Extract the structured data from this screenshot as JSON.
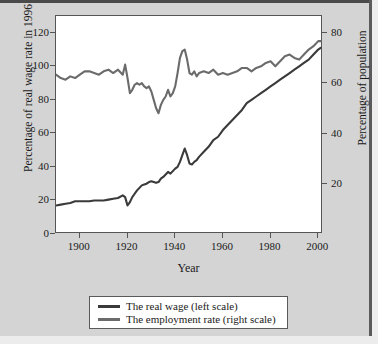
{
  "chart_data": {
    "type": "line",
    "title": "",
    "xlabel": "Year",
    "ylabel": "Percentage of real wage rate in 1996",
    "ylabel_right": "Percentage of population",
    "xlim": [
      1890,
      2002
    ],
    "ylim": [
      0,
      130
    ],
    "ylim_right": [
      0,
      86.9
    ],
    "grid": false,
    "legend_position": "below-axes",
    "xticks": [
      1900,
      1920,
      1940,
      1960,
      1980,
      2000
    ],
    "xticklabels": [
      "1900",
      "1920",
      "1940",
      "1960",
      "1980",
      "2000"
    ],
    "yticks": [
      0,
      20,
      40,
      60,
      80,
      100,
      120
    ],
    "yticklabels": [
      "0",
      "20",
      "40",
      "60",
      "80",
      "100",
      "120"
    ],
    "yticks_right": [
      20,
      40,
      60,
      80
    ],
    "yticklabels_right": [
      "20",
      "40",
      "60",
      "80"
    ],
    "series": [
      {
        "name": "The real wage (left scale)",
        "axis": "left",
        "color": "#3a3a3a",
        "linewidth": 2.1,
        "x": [
          1890,
          1892,
          1894,
          1896,
          1898,
          1900,
          1902,
          1904,
          1906,
          1908,
          1910,
          1912,
          1914,
          1916,
          1918,
          1919,
          1920,
          1921,
          1922,
          1923,
          1924,
          1925,
          1926,
          1927,
          1928,
          1929,
          1930,
          1931,
          1932,
          1933,
          1934,
          1935,
          1936,
          1937,
          1938,
          1939,
          1940,
          1941,
          1942,
          1943,
          1944,
          1945,
          1946,
          1947,
          1948,
          1949,
          1950,
          1952,
          1954,
          1956,
          1958,
          1960,
          1962,
          1964,
          1966,
          1968,
          1970,
          1972,
          1974,
          1976,
          1978,
          1980,
          1982,
          1984,
          1986,
          1988,
          1990,
          1992,
          1994,
          1996,
          1998,
          2000,
          2001
        ],
        "y": [
          17,
          17.5,
          18,
          18.5,
          19.5,
          19.5,
          19.5,
          19.5,
          20,
          20,
          20,
          20.5,
          21,
          21.5,
          23,
          22,
          17,
          19,
          22,
          24,
          26,
          27.5,
          29,
          29.5,
          30,
          31,
          31.5,
          31,
          30.5,
          31,
          33,
          34,
          35.5,
          37,
          36,
          37.5,
          39,
          40,
          43,
          47,
          51,
          47,
          42,
          41.5,
          43,
          44,
          46,
          49,
          52,
          56,
          58,
          62,
          65,
          68,
          71,
          74,
          78,
          80,
          82,
          84,
          86,
          88,
          90,
          92,
          94,
          96,
          98,
          100,
          102,
          104,
          107,
          110,
          111
        ]
      },
      {
        "name": "The employment rate (right scale)",
        "axis": "right",
        "color": "#6b6b6b",
        "linewidth": 2.1,
        "x": [
          1890,
          1892,
          1894,
          1896,
          1898,
          1900,
          1902,
          1904,
          1906,
          1908,
          1910,
          1912,
          1914,
          1916,
          1918,
          1919,
          1920,
          1921,
          1922,
          1923,
          1924,
          1925,
          1926,
          1927,
          1928,
          1929,
          1930,
          1931,
          1932,
          1933,
          1934,
          1935,
          1936,
          1937,
          1938,
          1939,
          1940,
          1941,
          1942,
          1943,
          1944,
          1945,
          1946,
          1947,
          1948,
          1949,
          1950,
          1952,
          1954,
          1956,
          1958,
          1960,
          1962,
          1964,
          1966,
          1968,
          1970,
          1972,
          1974,
          1976,
          1978,
          1980,
          1982,
          1984,
          1986,
          1988,
          1990,
          1992,
          1994,
          1996,
          1998,
          2000,
          2001
        ],
        "y_left_scale": [
          95,
          93,
          92,
          94,
          93,
          95,
          97,
          97,
          96,
          95,
          97,
          98,
          96,
          98,
          95,
          101,
          93,
          84,
          86,
          89,
          90,
          89,
          90,
          88,
          87,
          88,
          85,
          80,
          75,
          72,
          77,
          80,
          82,
          86,
          82,
          84,
          88,
          96,
          105,
          109,
          110,
          104,
          96,
          95,
          97,
          94,
          96,
          97,
          96,
          98,
          95,
          96,
          95,
          96,
          97,
          99,
          99,
          97,
          99,
          100,
          102,
          103,
          100,
          103,
          106,
          107,
          105,
          104,
          107,
          110,
          112,
          115,
          115
        ],
        "note": "employment series plotted against right axis; values listed in left-axis pixel scale equivalents"
      }
    ]
  },
  "axes": {
    "left_title": "Percentage of real wage rate in 1996",
    "right_title": "Percentage of population",
    "x_title": "Year"
  },
  "legend": {
    "entries": [
      {
        "label": "The real wage (left scale)",
        "color": "#3a3a3a"
      },
      {
        "label": "The employment rate (right scale)",
        "color": "#6b6b6b"
      }
    ]
  },
  "colors": {
    "background": "#d4d4d4",
    "plot_background": "#ffffff",
    "frame": "#555555",
    "real_wage": "#3a3a3a",
    "employment_rate": "#6b6b6b"
  }
}
